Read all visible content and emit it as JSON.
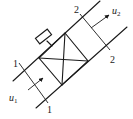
{
  "diagram": {
    "sections": {
      "inlet": {
        "top_label": "1",
        "bottom_label": "1"
      },
      "outlet": {
        "top_label": "2",
        "bottom_label": "2"
      }
    },
    "velocities": {
      "inlet": {
        "symbol": "u",
        "subscript": "1"
      },
      "outlet": {
        "symbol": "u",
        "subscript": "2"
      }
    },
    "components": [
      "duct",
      "fan-box",
      "motor"
    ],
    "colors": {
      "stroke": "#1a1a1a",
      "background": "#ffffff"
    }
  }
}
